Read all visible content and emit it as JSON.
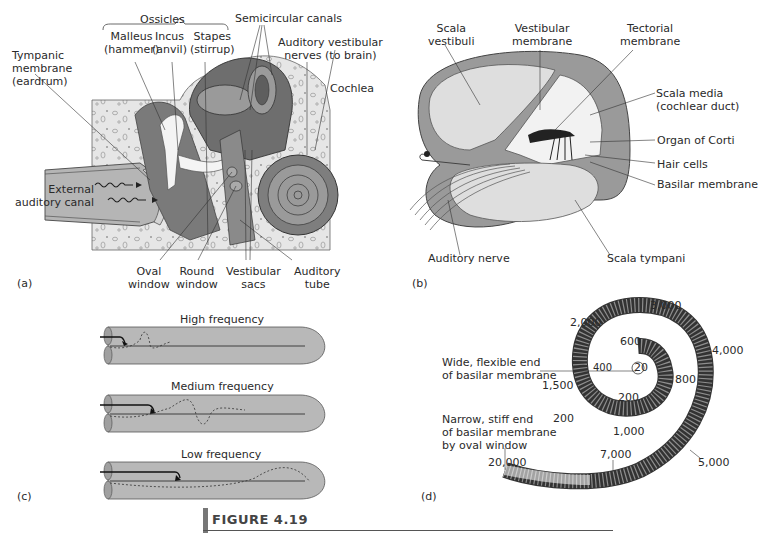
{
  "figure": {
    "title": "FIGURE 4.19",
    "panels": {
      "a": {
        "label": "(a)",
        "group_label": "Ossicles",
        "labels": {
          "malleus": [
            "Malleus",
            "(hammer)"
          ],
          "incus": [
            "Incus",
            "(anvil)"
          ],
          "stapes": [
            "Stapes",
            "(stirrup)"
          ],
          "semicircular": "Semicircular canals",
          "tympanic": [
            "Tympanic",
            "membrane",
            "(eardrum)"
          ],
          "nerves": [
            "Auditory vestibular",
            "nerves (to brain)"
          ],
          "cochlea": "Cochlea",
          "canal": [
            "External",
            "auditory canal"
          ],
          "oval": [
            "Oval",
            "window"
          ],
          "round": [
            "Round",
            "window"
          ],
          "vestibular_sacs": [
            "Vestibular",
            "sacs"
          ],
          "auditory_tube": [
            "Auditory",
            "tube"
          ]
        }
      },
      "b": {
        "label": "(b)",
        "labels": {
          "scala_vestibuli": [
            "Scala",
            "vestibuli"
          ],
          "vestibular_membrane": [
            "Vestibular",
            "membrane"
          ],
          "tectorial_membrane": [
            "Tectorial",
            "membrane"
          ],
          "scala_media": [
            "Scala media",
            "(cochlear duct)"
          ],
          "organ_corti": "Organ of Corti",
          "hair_cells": "Hair cells",
          "basilar_membrane": "Basilar membrane",
          "auditory_nerve": "Auditory nerve",
          "scala_tympani": "Scala tympani"
        }
      },
      "c": {
        "label": "(c)",
        "tubes": [
          {
            "title": "High frequency"
          },
          {
            "title": "Medium frequency"
          },
          {
            "title": "Low frequency"
          }
        ]
      },
      "d": {
        "label": "(d)",
        "wide_end": [
          "Wide, flexible end",
          "of basilar membrane"
        ],
        "narrow_end": [
          "Narrow, stiff end",
          "of basilar membrane",
          "by oval window"
        ],
        "frequencies": {
          "f20": "20",
          "f200a": "200",
          "f200b": "200",
          "f400": "400",
          "f600": "600",
          "f800": "800",
          "f1000": "1,000",
          "f1500": "1,500",
          "f2000": "2,000",
          "f3000": "3,000",
          "f4000": "4,000",
          "f5000": "5,000",
          "f7000": "7,000",
          "f20000": "20,000"
        }
      }
    }
  }
}
